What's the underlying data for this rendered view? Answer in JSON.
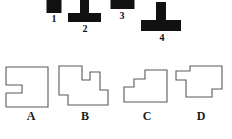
{
  "figure": {
    "kind": "spatial-reasoning-multiple-choice",
    "colors": {
      "block_fill": "#111111",
      "outline_stroke": "#5a5a5a",
      "page_background": "#ffffff",
      "label_color": "#1a1a1a"
    }
  },
  "top_blocks": {
    "items": [
      {
        "label": "1",
        "name": "block-1",
        "description": "small solid black rectangle, cropped at top edge",
        "x": 46,
        "y": 0,
        "width": 16,
        "height": 14
      },
      {
        "label": "2",
        "name": "block-2",
        "description": "solid black T shape, narrow vertical stem over wide horizontal base",
        "x": 66,
        "y": 0,
        "width": 36,
        "height": 24
      },
      {
        "label": "3",
        "name": "block-3",
        "description": "wide flat solid black rectangle, cropped at top edge",
        "x": 110,
        "y": 0,
        "width": 24,
        "height": 10
      },
      {
        "label": "4",
        "name": "block-4",
        "description": "large solid black T shape, narrow vertical stem over wide horizontal base",
        "x": 140,
        "y": 0,
        "width": 42,
        "height": 30
      }
    ]
  },
  "answer_options": {
    "items": [
      {
        "letter": "A",
        "name": "option-a",
        "description": "square outline with a rectangular notch cut into the left side",
        "x": 2
      },
      {
        "letter": "B",
        "name": "option-b",
        "description": "stepped outline: tall left block, central notch, raised middle step and lower right step",
        "x": 56
      },
      {
        "letter": "C",
        "name": "option-c",
        "description": "staircase outline rising in two steps from left to a tall right block",
        "x": 118
      },
      {
        "letter": "D",
        "name": "option-d",
        "description": "T-like outline: wide top bar with small left notch and right-side lower step",
        "x": 172
      }
    ]
  }
}
